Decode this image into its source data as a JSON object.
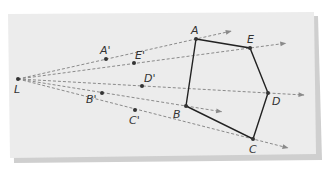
{
  "diagram": {
    "center": {
      "label": "L",
      "x": 18,
      "y": 79
    },
    "image_points": [
      {
        "label": "A'",
        "x": 106,
        "y": 59
      },
      {
        "label": "E'",
        "x": 134,
        "y": 63
      },
      {
        "label": "D'",
        "x": 142,
        "y": 86
      },
      {
        "label": "B'",
        "x": 102,
        "y": 93
      },
      {
        "label": "C'",
        "x": 135,
        "y": 110
      }
    ],
    "polygon_points": [
      {
        "label": "A",
        "x": 196,
        "y": 39
      },
      {
        "label": "E",
        "x": 250,
        "y": 48
      },
      {
        "label": "D",
        "x": 268,
        "y": 93
      },
      {
        "label": "C",
        "x": 253,
        "y": 139
      },
      {
        "label": "B",
        "x": 186,
        "y": 106
      }
    ],
    "colors": {
      "paper": "#ececec",
      "shadow": "#cfcfcf",
      "ray": "#8a8a8a",
      "polygon": "#222222",
      "point": "#333333"
    }
  }
}
